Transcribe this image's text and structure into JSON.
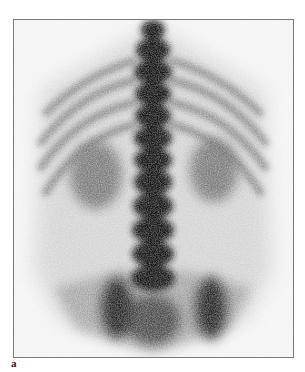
{
  "figure": {
    "panel_label": "a",
    "image_description": "Posterior whole-spine bone scintigraphy scan showing thoracic/lumbar spine, ribs, kidneys and pelvis",
    "colors": {
      "background": "#ffffff",
      "frame_border": "#7a7a7a",
      "scan_background": "#f4f4f4",
      "uptake_dark": "#141414"
    }
  }
}
